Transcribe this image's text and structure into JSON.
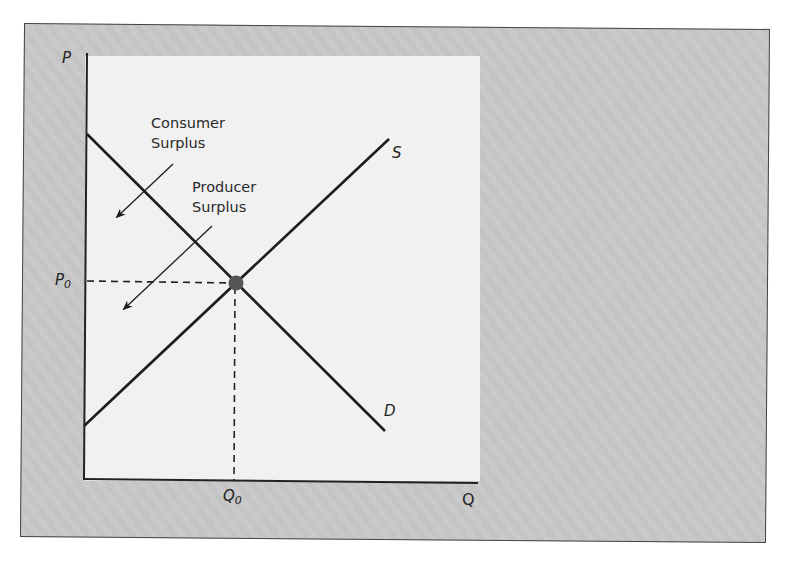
{
  "diagram": {
    "type": "supply-demand",
    "axes": {
      "y_label": "P",
      "x_label": "Q",
      "equilibrium_price_label": "P",
      "equilibrium_price_subscript": "0",
      "equilibrium_quantity_label": "Q",
      "equilibrium_quantity_subscript": "0"
    },
    "curves": [
      {
        "name": "S",
        "label": "S",
        "from": [
          84,
          426
        ],
        "to": [
          389,
          139
        ]
      },
      {
        "name": "D",
        "label": "D",
        "from": [
          87,
          134
        ],
        "to": [
          385,
          431
        ]
      }
    ],
    "equilibrium": {
      "x": 235,
      "y": 283
    },
    "annotations": {
      "consumer_surplus": {
        "line1": "Consumer",
        "line2": "Surplus"
      },
      "producer_surplus": {
        "line1": "Producer",
        "line2": "Surplus"
      }
    },
    "colors": {
      "frame": "#c9c9c9",
      "panel": "#f1f1f1",
      "line": "#1c1c1c",
      "dot": "#555555"
    }
  }
}
